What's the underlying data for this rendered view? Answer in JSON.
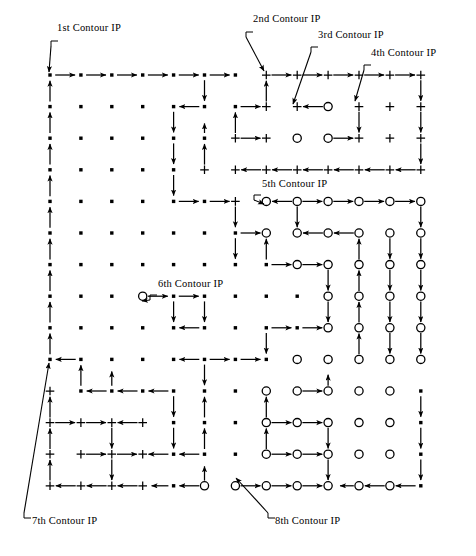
{
  "figure": {
    "width": 476,
    "height": 556,
    "background": "#ffffff",
    "ink": "#000000"
  },
  "grid": {
    "cols": 13,
    "rows": 14,
    "x0": 50,
    "y0": 75,
    "dx": 30.9,
    "dy": 31.6,
    "marker_legend": {
      "dot": "filled-square-point",
      "plus": "plus-point",
      "circle": "open-circle-point"
    },
    "marker_map": [
      "dddddddpppppp",
      "dddddddppoppp",
      "ddddddppoopppp",
      "dddddppppppppp",
      "ddddddpoooooo",
      "dddddddoooooo",
      "ddddddddooooo",
      "dddodddddoooo",
      "dddddddddoooo",
      "ddddddddooooo",
      "pddddddooooo",
      "ppppdddooooo",
      "ppppdddooooo",
      "ppppdooooooo"
    ]
  },
  "labels": [
    {
      "id": "ip1",
      "text": "1st Contour IP",
      "x": 57,
      "y": 29,
      "leader_from": [
        55,
        41
      ],
      "leader_to": [
        49,
        72
      ]
    },
    {
      "id": "ip2",
      "text": "2nd Contour IP",
      "x": 253,
      "y": 20,
      "leader_from": [
        250,
        32
      ],
      "leader_to": [
        264,
        71
      ]
    },
    {
      "id": "ip3",
      "text": "3rd Contour IP",
      "x": 318,
      "y": 36,
      "leader_from": [
        315,
        47
      ],
      "leader_to": [
        293,
        104
      ]
    },
    {
      "id": "ip4",
      "text": "4th Contour IP",
      "x": 371,
      "y": 54,
      "leader_from": [
        368,
        65
      ],
      "leader_to": [
        355,
        101
      ]
    },
    {
      "id": "ip5",
      "text": "5th Contour IP",
      "x": 262,
      "y": 185,
      "leader_from": [
        258,
        195
      ],
      "leader_to": [
        264,
        204
      ]
    },
    {
      "id": "ip6",
      "text": "6th Contour IP",
      "x": 158,
      "y": 285,
      "leader_from": [
        154,
        295
      ],
      "leader_to": [
        142,
        301
      ]
    },
    {
      "id": "ip7",
      "text": "7th Contour IP",
      "x": 32,
      "y": 522,
      "leader_from": [
        28,
        518
      ],
      "leader_to": [
        49,
        363
      ]
    },
    {
      "id": "ip8",
      "text": "8th Contour IP",
      "x": 275,
      "y": 522,
      "leader_from": [
        272,
        518
      ],
      "leader_to": [
        236,
        478
      ]
    }
  ],
  "contours": [
    {
      "id": "contour-1",
      "name": "1st contour path",
      "ip": [
        0,
        0
      ],
      "segments": "outer-left boundary and top row tracing"
    },
    {
      "id": "contour-2",
      "name": "2nd contour path",
      "ip": [
        7,
        0
      ]
    },
    {
      "id": "contour-3",
      "name": "3rd contour path",
      "ip": [
        8,
        1
      ]
    },
    {
      "id": "contour-4",
      "name": "4th contour path",
      "ip": [
        10,
        1
      ]
    },
    {
      "id": "contour-5",
      "name": "5th contour path",
      "ip": [
        7,
        4
      ]
    },
    {
      "id": "contour-6",
      "name": "6th contour path",
      "ip": [
        3,
        7
      ]
    },
    {
      "id": "contour-7",
      "name": "7th contour path",
      "ip": [
        0,
        10
      ]
    },
    {
      "id": "contour-8",
      "name": "8th contour path",
      "ip": [
        6,
        13
      ]
    }
  ]
}
